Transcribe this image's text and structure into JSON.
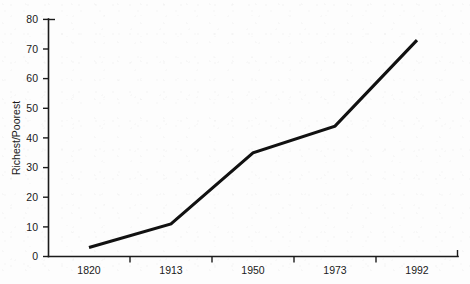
{
  "chart_data": {
    "type": "line",
    "title": "",
    "xlabel": "",
    "ylabel": "Richest/Poorest",
    "categories": [
      "1820",
      "1913",
      "1950",
      "1973",
      "1992"
    ],
    "values": [
      3,
      11,
      35,
      44,
      73
    ],
    "series": [
      {
        "name": "Richest/Poorest",
        "values": [
          3,
          11,
          35,
          44,
          73
        ]
      }
    ],
    "ylim": [
      0,
      80
    ],
    "ytick_labels": [
      "0",
      "10",
      "20",
      "30",
      "40",
      "50",
      "60",
      "70",
      "80"
    ],
    "ytick_values": [
      0,
      10,
      20,
      30,
      40,
      50,
      60,
      70,
      80
    ],
    "grid": false,
    "legend": "none",
    "line_color": "#111111",
    "axis_color": "#1b1b1b",
    "background_color": "#fdfdfd",
    "markers": false
  }
}
